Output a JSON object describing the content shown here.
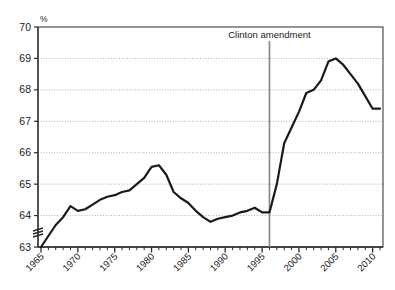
{
  "chart_data": {
    "type": "line",
    "title": "",
    "subtitle": "",
    "xlabel": "",
    "ylabel": "%",
    "unit_label": "%",
    "grid": true,
    "grid_style": "dotted-horizontal",
    "legend": false,
    "legend_position": "none",
    "axis_break_y": true,
    "axis_break_note": "y-axis broken below 63",
    "xlim": [
      1965,
      2011
    ],
    "ylim": [
      63,
      70
    ],
    "ytick_labels": [
      "63",
      "64",
      "65",
      "66",
      "67",
      "68",
      "69",
      "70"
    ],
    "yticks": [
      63,
      64,
      65,
      66,
      67,
      68,
      69,
      70
    ],
    "xtick_labels": [
      "1965",
      "1970",
      "1975",
      "1980",
      "1985",
      "1990",
      "1995",
      "2000",
      "2005",
      "2010"
    ],
    "xticks_major": [
      1965,
      1970,
      1975,
      1980,
      1985,
      1990,
      1995,
      2000,
      2005,
      2010
    ],
    "xtick_minor_interval": 1,
    "line_color": "#1a1a1a",
    "annotations": [
      {
        "label": "Clinton amendment",
        "x": 1996,
        "type": "vertical-line-with-label",
        "color": "#8a8a8a"
      }
    ],
    "series": [
      {
        "name": "Homeownership rate",
        "x": [
          1965,
          1966,
          1967,
          1968,
          1969,
          1970,
          1971,
          1972,
          1973,
          1974,
          1975,
          1976,
          1977,
          1978,
          1979,
          1980,
          1981,
          1982,
          1983,
          1984,
          1985,
          1986,
          1987,
          1988,
          1989,
          1990,
          1991,
          1992,
          1993,
          1994,
          1995,
          1996,
          1997,
          1998,
          1999,
          2000,
          2001,
          2002,
          2003,
          2004,
          2005,
          2006,
          2007,
          2008,
          2009,
          2010,
          2011
        ],
        "values": [
          63.0,
          63.35,
          63.7,
          63.95,
          64.3,
          64.15,
          64.2,
          64.35,
          64.5,
          64.6,
          64.65,
          64.75,
          64.8,
          65.0,
          65.2,
          65.55,
          65.6,
          65.3,
          64.75,
          64.55,
          64.4,
          64.15,
          63.95,
          63.8,
          63.9,
          63.95,
          64.0,
          64.1,
          64.15,
          64.25,
          64.1,
          64.1,
          65.0,
          66.3,
          66.8,
          67.3,
          67.9,
          68.0,
          68.3,
          68.9,
          69.0,
          68.8,
          68.5,
          68.2,
          67.8,
          67.4,
          67.4
        ],
        "color": "#1a1a1a",
        "line_width": 2.2,
        "start_value": 63.0,
        "peak_value": 69.0,
        "peak_year": 2005,
        "end_value": 67.4
      }
    ]
  },
  "geometry": {
    "plot_left": 38,
    "plot_right": 383,
    "plot_top": 27,
    "plot_bottom": 247
  }
}
